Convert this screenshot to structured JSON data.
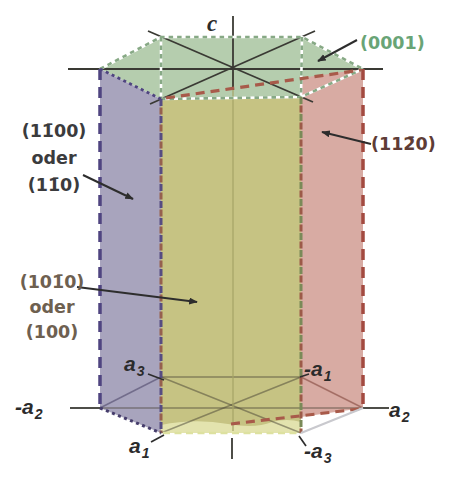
{
  "figure": {
    "axes": {
      "c": {
        "base": "c"
      },
      "a1": {
        "base": "a",
        "sub": "1"
      },
      "a2": {
        "base": "a",
        "sub": "2"
      },
      "a3": {
        "base": "a",
        "sub": "3"
      },
      "neg_a1": {
        "base": "-a",
        "sub": "1"
      },
      "neg_a2": {
        "base": "-a",
        "sub": "2"
      },
      "neg_a3": {
        "base": "-a",
        "sub": "3"
      }
    },
    "planes": {
      "top": {
        "label": "(0001)",
        "color": "#69a476",
        "face_fill": "#b5cdae"
      },
      "left": {
        "lines": [
          "(11̄00)",
          "oder",
          "(11̄0)"
        ],
        "color": "#3b3b3d",
        "face_fill": "#a8a4bd"
      },
      "front": {
        "lines": [
          "(101̄0)",
          "oder",
          "(100)"
        ],
        "color": "#6e6050",
        "face_fill": "#c6c383"
      },
      "right": {
        "label": "(112̄0)",
        "color": "#5e3c36",
        "face_fill": "#d8aba3"
      }
    },
    "edge_colors": {
      "left_dash": "#4f4480",
      "right_dash": "#a34a40",
      "top_border": "#87a985",
      "hidden_red_dash": "#a85a4a",
      "bottom_front_dash": "#dde1a0"
    }
  }
}
